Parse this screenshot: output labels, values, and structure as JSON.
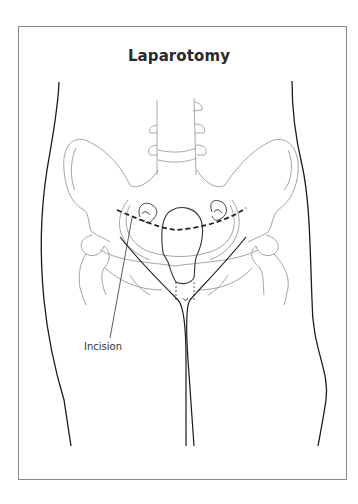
{
  "figure": {
    "title": "Laparotomy",
    "labels": {
      "incision": "Incision"
    },
    "anatomy": [
      "body-outline",
      "lumbar-spine",
      "pelvis",
      "hip-joints",
      "uterus",
      "left-ovary",
      "right-ovary",
      "legs"
    ],
    "colors": {
      "outline": "#1a1a1a",
      "bone": "#9a9a9a",
      "organ": "#333333",
      "incision_line": "#222222",
      "frame": "#8a8a8a"
    }
  }
}
